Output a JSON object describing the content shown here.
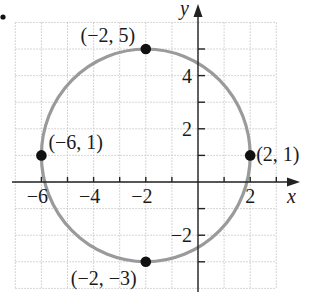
{
  "chart_data": {
    "type": "scatter",
    "title": "",
    "xlabel": "x",
    "ylabel": "y",
    "xlim": [
      -7,
      3
    ],
    "ylim": [
      -4,
      6
    ],
    "grid": true,
    "x_tick_labels": [
      {
        "value": -6,
        "label": "−6"
      },
      {
        "value": -4,
        "label": "−4"
      },
      {
        "value": -2,
        "label": "−2"
      },
      {
        "value": 2,
        "label": "2"
      }
    ],
    "y_tick_labels": [
      {
        "value": 4,
        "label": "4"
      },
      {
        "value": 2,
        "label": "2"
      },
      {
        "value": -2,
        "label": "−2"
      }
    ],
    "curve": {
      "kind": "circle",
      "center": [
        -2,
        1
      ],
      "radius": 4,
      "equation": "(x + 2)^2 + (y - 1)^2 = 16",
      "color": "#9a9a9a"
    },
    "points": [
      {
        "x": -2,
        "y": 5,
        "label": "(−2, 5)"
      },
      {
        "x": -6,
        "y": 1,
        "label": "(−6, 1)"
      },
      {
        "x": 2,
        "y": 1,
        "label": "(2, 1)"
      },
      {
        "x": -2,
        "y": -3,
        "label": "(−2, −3)"
      }
    ],
    "point_color": "#111111"
  },
  "axes": {
    "x_label": "x",
    "y_label": "y"
  },
  "colors": {
    "circle": "#9a9a9a",
    "points": "#111111",
    "axes": "#222222",
    "grid": "#c8c8c8"
  }
}
